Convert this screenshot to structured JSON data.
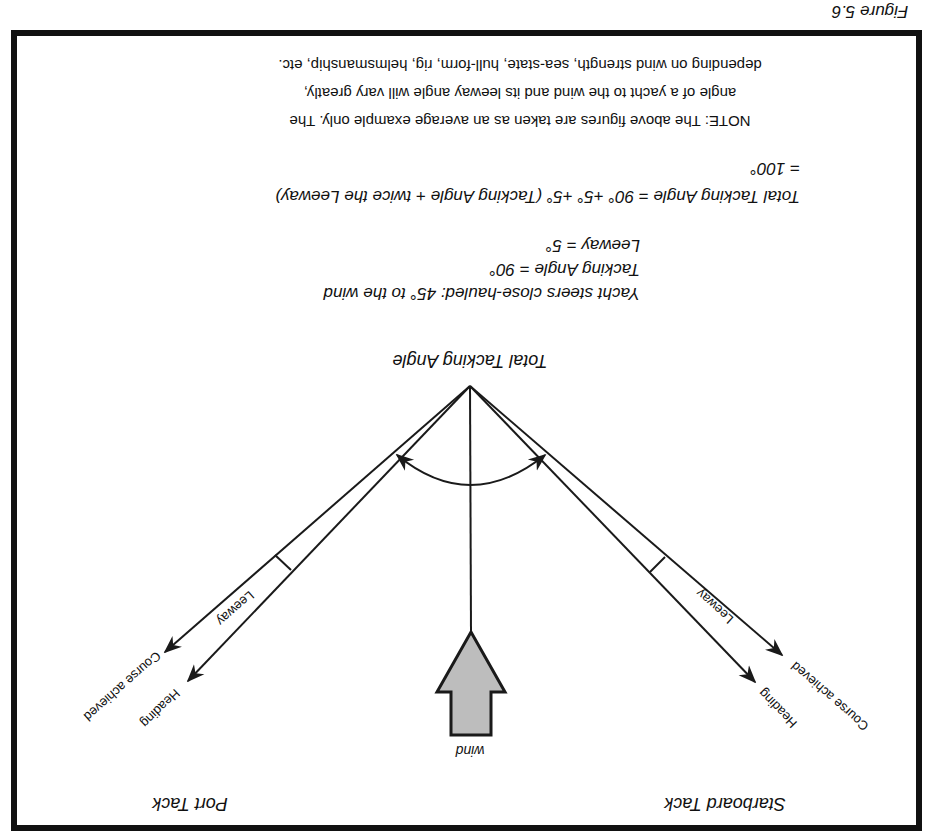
{
  "figure_label": "Figure 5.6",
  "orientation": "rotated 180 degrees",
  "tacks": {
    "starboard": "Starboard Tack",
    "port": "Port Tack"
  },
  "wind_label": "wind",
  "arrow_labels": {
    "heading": "Heading",
    "course_achieved": "Course achieved",
    "leeway": "Leeway"
  },
  "angle_label": "Total Tacking Angle",
  "explanation": {
    "line1": "Yacht steers close-hauled: 45° to the wind",
    "line2": "Tacking Angle = 90°",
    "line3": "Leeway = 5°",
    "formula_line1": "Total Tacking Angle = 90° +5° +5° (Tacking Angle + twice the Leeway)",
    "formula_line2": "= 100°"
  },
  "note": {
    "line1": "NOTE: The above figures are taken as an average example only. The",
    "line2": "angle of a yacht to the wind and its leeway angle will vary greatly,",
    "line3": "depending on wind strength, sea-state, hull-form, rig, helmsmanship, etc."
  },
  "values": {
    "close_hauled_angle_deg": 45,
    "tacking_angle_deg": 90,
    "leeway_deg": 5,
    "total_tacking_angle_deg": 100
  },
  "colors": {
    "frame": "#111111",
    "line": "#1a1a1a",
    "wind_arrow_fill": "#bdbdbd",
    "background": "#ffffff"
  }
}
